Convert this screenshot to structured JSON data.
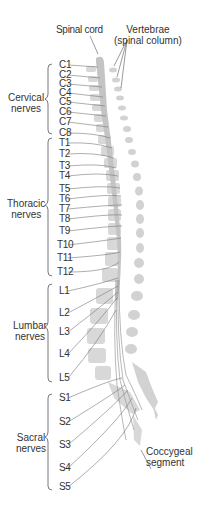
{
  "title_labels": {
    "spinal_cord": "Spinal cord",
    "vertebrae": "Vertebrae\n(spinal column)",
    "coccygeal": "Coccygeal\nsegment"
  },
  "groups": [
    {
      "name": "Cervical\nnerves"
    },
    {
      "name": "Thoracic\nnerves"
    },
    {
      "name": "Lumbar\nnerves"
    },
    {
      "name": "Sacral\nnerves"
    }
  ],
  "nerves": [
    {
      "label": "C1",
      "y": 65
    },
    {
      "label": "C2",
      "y": 75
    },
    {
      "label": "C3",
      "y": 84
    },
    {
      "label": "C4",
      "y": 93
    },
    {
      "label": "C5",
      "y": 102
    },
    {
      "label": "C6",
      "y": 112
    },
    {
      "label": "C7",
      "y": 122
    },
    {
      "label": "C8",
      "y": 133
    },
    {
      "label": "T1",
      "y": 143
    },
    {
      "label": "T2",
      "y": 154
    },
    {
      "label": "T3",
      "y": 166
    },
    {
      "label": "T4",
      "y": 176
    },
    {
      "label": "T5",
      "y": 189
    },
    {
      "label": "T6",
      "y": 199
    },
    {
      "label": "T7",
      "y": 209
    },
    {
      "label": "T8",
      "y": 219
    },
    {
      "label": "T9",
      "y": 231
    },
    {
      "label": "T10",
      "y": 245
    },
    {
      "label": "T11",
      "y": 258
    },
    {
      "label": "T12",
      "y": 272
    },
    {
      "label": "L1",
      "y": 291
    },
    {
      "label": "L2",
      "y": 313
    },
    {
      "label": "L3",
      "y": 332
    },
    {
      "label": "L4",
      "y": 354
    },
    {
      "label": "L5",
      "y": 378
    },
    {
      "label": "S1",
      "y": 398
    },
    {
      "label": "S2",
      "y": 422
    },
    {
      "label": "S3",
      "y": 445
    },
    {
      "label": "S4",
      "y": 468
    },
    {
      "label": "S5",
      "y": 487
    }
  ],
  "colors": {
    "bone": "#d6d6d6",
    "cord": "#c4c4c4",
    "line": "#666666",
    "text": "#333333"
  }
}
